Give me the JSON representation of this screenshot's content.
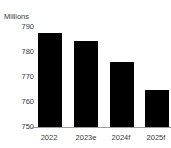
{
  "chart_data": {
    "type": "bar",
    "title": "",
    "subtitle": "",
    "unit_label": "Millions",
    "xlabel": "",
    "ylabel": "Millions",
    "categories": [
      "2022",
      "2023e",
      "2024f",
      "2025f"
    ],
    "values": [
      787.5,
      784.5,
      776,
      765
    ],
    "ylim": [
      750,
      790
    ],
    "yticks": [
      "790",
      "780",
      "770",
      "760",
      "750"
    ],
    "ytick_values": [
      790,
      780,
      770,
      760,
      750
    ],
    "grid": false,
    "legend": null,
    "bar_color": "#000000",
    "axis_color": "#9a9a9a",
    "text_color": "#3a3a3a"
  },
  "series_label": "Units"
}
